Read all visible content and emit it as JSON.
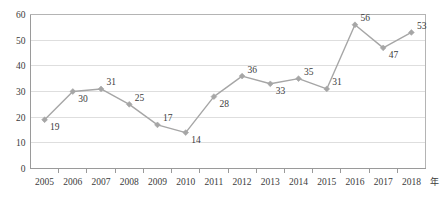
{
  "chart_data": {
    "type": "line",
    "title": "",
    "subtitle": "",
    "xlabel": "年",
    "ylabel": "",
    "categories": [
      "2005",
      "2006",
      "2007",
      "2008",
      "2009",
      "2010",
      "2011",
      "2012",
      "2013",
      "2014",
      "2015",
      "2016",
      "2017",
      "2018"
    ],
    "values": [
      19,
      30,
      31,
      25,
      17,
      14,
      28,
      36,
      33,
      35,
      31,
      56,
      47,
      53
    ],
    "data_labels": [
      "19",
      "30",
      "31",
      "25",
      "17",
      "14",
      "28",
      "36",
      "33",
      "35",
      "31",
      "56",
      "47",
      "53"
    ],
    "label_positions": [
      "below-right",
      "below-right",
      "above-right",
      "above-right",
      "above-right",
      "below-right",
      "below-right",
      "above-right",
      "below-right",
      "above-right",
      "above-right",
      "above-right",
      "below-right",
      "above-right"
    ],
    "ylim": [
      0,
      60
    ],
    "ytick_labels": [
      "0",
      "10",
      "20",
      "30",
      "40",
      "50",
      "60"
    ],
    "ytick_values": [
      0,
      10,
      20,
      30,
      40,
      50,
      60
    ],
    "grid": "horizontal",
    "legend": "none",
    "series_color": "#a6a6a6",
    "grid_color": "#d6d6d6",
    "axis_color": "#9a9a9a",
    "text_color": "#3b3b3b",
    "marker": "diamond"
  }
}
